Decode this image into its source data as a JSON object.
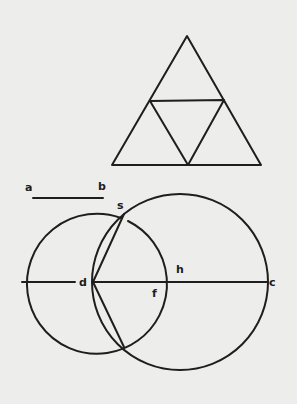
{
  "diagram": {
    "background": "#ededec",
    "stroke_color": "#1e1e1e",
    "triangle": {
      "outer": [
        [
          187,
          36
        ],
        [
          112,
          165
        ],
        [
          261,
          165
        ]
      ],
      "inner": [
        [
          150,
          101
        ],
        [
          224,
          100
        ],
        [
          188,
          165
        ]
      ]
    },
    "segment_ab": {
      "x1": 33,
      "y1": 198,
      "x2": 103,
      "y2": 198
    },
    "circle_left": {
      "cx": 93,
      "cy": 282,
      "r": 70
    },
    "circle_right": {
      "cx": 196,
      "cy": 282,
      "r": 103
    },
    "diameter": {
      "x1": 22,
      "y1": 282,
      "x2": 267,
      "y2": 282
    },
    "chords": [
      {
        "x1": 93,
        "y1": 282,
        "x2": 123,
        "y2": 207
      },
      {
        "x1": 93,
        "y1": 282,
        "x2": 123,
        "y2": 347
      }
    ],
    "labels": {
      "a": "a",
      "b": "b",
      "s": "s",
      "d": "d",
      "f": "f",
      "h": "h",
      "c": "c"
    }
  }
}
